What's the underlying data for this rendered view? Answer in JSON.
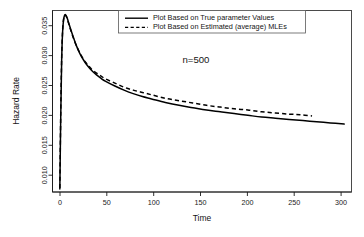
{
  "chart_data": {
    "type": "line",
    "title": "",
    "xlabel": "Time",
    "ylabel": "Hazard Rate",
    "xlim": [
      -8,
      318
    ],
    "ylim": [
      0.0075,
      0.0385
    ],
    "grid": false,
    "legend_position": "top-center",
    "annotations": [
      {
        "text": "n=500",
        "x": 150,
        "y": 0.0322
      }
    ],
    "xticks": [
      0,
      50,
      100,
      150,
      200,
      250,
      300
    ],
    "xtick_labels": [
      "0",
      "50",
      "100",
      "150",
      "200",
      "250",
      "300"
    ],
    "yticks": [
      0.01,
      0.015,
      0.02,
      0.025,
      0.03,
      0.035
    ],
    "ytick_labels": [
      "0.010",
      "0.015",
      "0.020",
      "0.025",
      "0.030",
      "0.035"
    ],
    "series": [
      {
        "name": "Plot Based on True parameter Values",
        "style": "solid",
        "color": "#000000",
        "x": [
          0,
          1,
          2,
          3,
          4,
          5,
          6,
          7,
          8,
          10,
          12,
          15,
          18,
          22,
          26,
          30,
          35,
          40,
          45,
          50,
          60,
          70,
          80,
          90,
          100,
          115,
          130,
          145,
          160,
          175,
          190,
          205,
          220,
          235,
          250,
          265,
          280,
          295,
          310
        ],
        "y": [
          0.008,
          0.0205,
          0.03,
          0.0348,
          0.0368,
          0.0376,
          0.0378,
          0.0376,
          0.0372,
          0.0362,
          0.0352,
          0.0338,
          0.0325,
          0.0311,
          0.03,
          0.0291,
          0.0282,
          0.0275,
          0.0269,
          0.0264,
          0.0256,
          0.0249,
          0.0243,
          0.0238,
          0.0234,
          0.0228,
          0.0223,
          0.0219,
          0.0215,
          0.0212,
          0.0209,
          0.0206,
          0.0203,
          0.0201,
          0.0199,
          0.0197,
          0.0195,
          0.0193,
          0.0191
        ]
      },
      {
        "name": "Plot Based on Estimated (average) MLEs",
        "style": "dashed",
        "color": "#000000",
        "x": [
          0,
          1,
          2,
          3,
          4,
          5,
          6,
          7,
          8,
          10,
          12,
          15,
          18,
          22,
          26,
          30,
          35,
          40,
          45,
          50,
          60,
          70,
          80,
          90,
          100,
          115,
          130,
          145,
          160,
          175,
          190,
          205,
          220,
          235,
          250,
          262,
          275
        ],
        "y": [
          0.0082,
          0.0212,
          0.0305,
          0.035,
          0.0369,
          0.0376,
          0.0377,
          0.0375,
          0.0371,
          0.0361,
          0.0351,
          0.0337,
          0.0325,
          0.0312,
          0.0301,
          0.0293,
          0.0284,
          0.0278,
          0.0273,
          0.0268,
          0.0261,
          0.0254,
          0.0249,
          0.0245,
          0.0241,
          0.0235,
          0.0231,
          0.0227,
          0.0223,
          0.022,
          0.0217,
          0.0215,
          0.0212,
          0.021,
          0.0208,
          0.0207,
          0.0205
        ]
      }
    ]
  },
  "legend": {
    "entries": [
      {
        "label": "Plot Based on True parameter Values",
        "style": "solid"
      },
      {
        "label": "Plot Based on Estimated (average) MLEs",
        "style": "dashed"
      }
    ]
  },
  "axes": {
    "x_title": "Time",
    "y_title": "Hazard Rate"
  }
}
